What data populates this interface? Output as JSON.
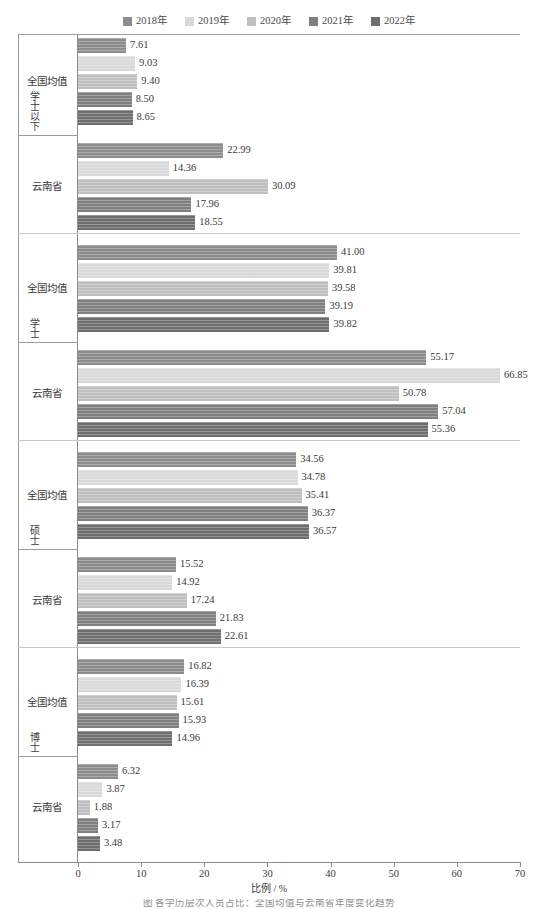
{
  "legend": {
    "items": [
      {
        "label": "2018年",
        "color": "#8c8c8c"
      },
      {
        "label": "2019年",
        "color": "#d9d9d9"
      },
      {
        "label": "2020年",
        "color": "#bfbfbf"
      },
      {
        "label": "2021年",
        "color": "#7f7f7f"
      },
      {
        "label": "2022年",
        "color": "#6e6e6e"
      }
    ]
  },
  "axis": {
    "x_title": "比例 / %",
    "x_ticks": [
      "0",
      "10",
      "20",
      "30",
      "40",
      "50",
      "60",
      "70"
    ],
    "x_min": 0,
    "x_max": 70
  },
  "caption": "图 各学历层次人员占比：全国均值与云南省年度变化趋势",
  "groups": [
    {
      "name": "学士以下",
      "subgroups": [
        {
          "name": "全国均值",
          "values": [
            "7.61",
            "9.03",
            "9.40",
            "8.50",
            "8.65"
          ]
        },
        {
          "name": "云南省",
          "values": [
            "22.99",
            "14.36",
            "30.09",
            "17.96",
            "18.55"
          ]
        }
      ]
    },
    {
      "name": "学士",
      "subgroups": [
        {
          "name": "全国均值",
          "values": [
            "41.00",
            "39.81",
            "39.58",
            "39.19",
            "39.82"
          ]
        },
        {
          "name": "云南省",
          "values": [
            "55.17",
            "66.85",
            "50.78",
            "57.04",
            "55.36"
          ]
        }
      ]
    },
    {
      "name": "硕士",
      "subgroups": [
        {
          "name": "全国均值",
          "values": [
            "34.56",
            "34.78",
            "35.41",
            "36.37",
            "36.57"
          ]
        },
        {
          "name": "云南省",
          "values": [
            "15.52",
            "14.92",
            "17.24",
            "21.83",
            "22.61"
          ]
        }
      ]
    },
    {
      "name": "博士",
      "subgroups": [
        {
          "name": "全国均值",
          "values": [
            "16.82",
            "16.39",
            "15.61",
            "15.93",
            "14.96"
          ]
        },
        {
          "name": "云南省",
          "values": [
            "6.32",
            "3.87",
            "1.88",
            "3.17",
            "3.48"
          ]
        }
      ]
    }
  ],
  "chart_data": {
    "type": "bar",
    "orientation": "horizontal",
    "title": "",
    "xlabel": "比例 / %",
    "ylabel": "",
    "xlim": [
      0,
      70
    ],
    "grid": false,
    "legend_position": "top-center",
    "categories": [
      "学士以下 - 全国均值",
      "学士以下 - 云南省",
      "学士 - 全国均值",
      "学士 - 云南省",
      "硕士 - 全国均值",
      "硕士 - 云南省",
      "博士 - 全国均值",
      "博士 - 云南省"
    ],
    "series": [
      {
        "name": "2018年",
        "color": "#8c8c8c",
        "values": [
          7.61,
          22.99,
          41.0,
          55.17,
          34.56,
          15.52,
          16.82,
          6.32
        ]
      },
      {
        "name": "2019年",
        "color": "#d9d9d9",
        "values": [
          9.03,
          14.36,
          39.81,
          66.85,
          34.78,
          14.92,
          16.39,
          3.87
        ]
      },
      {
        "name": "2020年",
        "color": "#bfbfbf",
        "values": [
          9.4,
          30.09,
          39.58,
          50.78,
          35.41,
          17.24,
          15.61,
          1.88
        ]
      },
      {
        "name": "2021年",
        "color": "#7f7f7f",
        "values": [
          8.5,
          17.96,
          39.19,
          57.04,
          36.37,
          21.83,
          15.93,
          3.17
        ]
      },
      {
        "name": "2022年",
        "color": "#6e6e6e",
        "values": [
          8.65,
          18.55,
          39.82,
          55.36,
          36.57,
          22.61,
          14.96,
          3.48
        ]
      }
    ]
  }
}
